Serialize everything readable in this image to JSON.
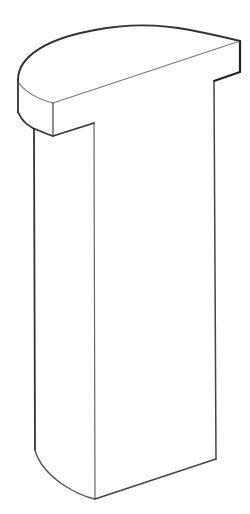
{
  "figure": {
    "background_color": "#ffffff",
    "stroke_color": "#3a3a3a",
    "stroke_color_light": "#7a7a7a",
    "parts": [
      {
        "id": "top-cap",
        "label": "half-round top cap"
      },
      {
        "id": "column",
        "label": "column body with rounded left edge"
      }
    ]
  }
}
